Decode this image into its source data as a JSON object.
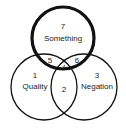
{
  "diagram": {
    "type": "venn",
    "circles": [
      {
        "id": "something",
        "number": "7",
        "label": "Something",
        "emphasized": true
      },
      {
        "id": "quality",
        "number": "1",
        "label": "Quality",
        "emphasized": false
      },
      {
        "id": "negation",
        "number": "3",
        "label": "Negation",
        "emphasized": false
      }
    ],
    "intersections": {
      "quality_negation": "2",
      "something_quality": "5",
      "something_negation": "6",
      "all_three": "4"
    },
    "colors": {
      "stroke": "#111111",
      "background": "#ffffff",
      "text": "#222222"
    }
  }
}
